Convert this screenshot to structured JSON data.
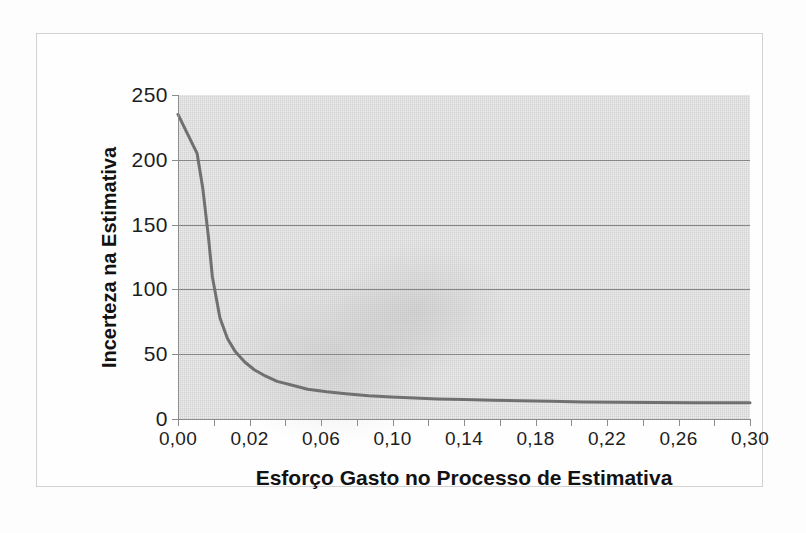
{
  "figure": {
    "background_color": "#fefefe",
    "plot_background_color": "#ebebeb",
    "frame_color": "#d2d2d2"
  },
  "chart_data": {
    "type": "line",
    "title": "",
    "xlabel": "Esforço Gasto no Processo de Estimativa",
    "ylabel": "Incerteza na Estimativa",
    "xlim": [
      0.0,
      0.3
    ],
    "ylim": [
      0,
      250
    ],
    "grid": true,
    "grid_axis": "y",
    "legend": false,
    "line_color": "#707070",
    "line_width": 3,
    "xtick_labels": [
      "0,00",
      "0,02",
      "0,06",
      "0,10",
      "0,14",
      "0,18",
      "0,22",
      "0,26",
      "0,30"
    ],
    "xtick_values": [
      0.0,
      0.02,
      0.06,
      0.1,
      0.14,
      0.18,
      0.22,
      0.26,
      0.3
    ],
    "xtick_minor_count_between": 1,
    "ytick_labels": [
      "0",
      "50",
      "100",
      "150",
      "200",
      "250"
    ],
    "ytick_values": [
      0,
      50,
      100,
      150,
      200,
      250
    ],
    "series": [
      {
        "name": "Incerteza na Estimativa",
        "x": [
          0.0,
          0.005,
          0.01,
          0.013,
          0.016,
          0.018,
          0.022,
          0.026,
          0.03,
          0.035,
          0.04,
          0.046,
          0.052,
          0.06,
          0.068,
          0.078,
          0.088,
          0.1,
          0.112,
          0.124,
          0.136,
          0.15,
          0.165,
          0.18,
          0.196,
          0.212,
          0.23,
          0.25,
          0.27,
          0.29,
          0.3
        ],
        "y": [
          235,
          220,
          205,
          178,
          140,
          110,
          78,
          62,
          52,
          44,
          38,
          33,
          29,
          26,
          23,
          21,
          19.5,
          18,
          17,
          16.2,
          15.5,
          15,
          14.5,
          14,
          13.6,
          13.2,
          13,
          12.8,
          12.6,
          12.5,
          12.5
        ]
      }
    ]
  }
}
